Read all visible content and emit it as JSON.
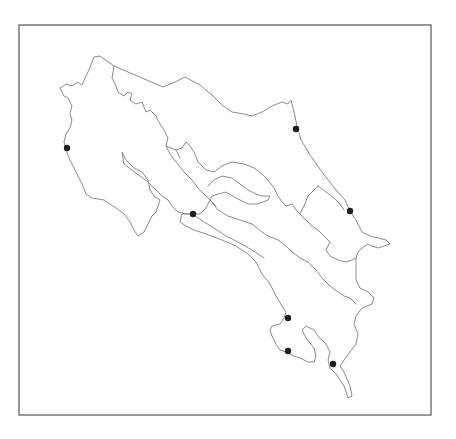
{
  "map": {
    "frame": {
      "x": 19,
      "y": 25,
      "width": 412,
      "height": 390
    },
    "colors": {
      "frame": "#6e6e6e",
      "outline": "#8a8a8a",
      "marker": "#1e1e1e",
      "background": "#ffffff"
    },
    "outlines": [
      "M60,88 L66,84 L72,86 L78,82 L82,85 L85,78 L88,72 L94,57 L100,56 L114,66 L163,87 L175,82 L185,77 L200,85 L212,95 L222,105 L232,112 L244,114 L252,116 L262,112 L272,106 L282,102 L288,104 L291,100 L294,112 L297,126 L301,140 L310,155 L322,172 L336,190 L345,200 L350,211 L356,220 L362,232 L370,236 L378,238 L386,240 L390,244 L384,246 L378,248 L372,246 L368,244 L362,248 L358,252 L356,258 L356,280 L360,288 L368,292 L374,298 L372,304 L362,308 L356,316 L354,324 L358,334 L356,344 L350,352 L344,360 L340,366 L344,372 L350,386 L352,396 L348,398 L344,386 L336,374 L330,368 L328,360 L330,352 L326,344 L318,336 L314,330 L306,326 L302,330 L306,338 L314,348 L316,356 L314,362 L308,362 L300,358 L294,356 L286,352 L280,350 L276,344 L272,336 L270,330 L272,326 L280,324 L284,318 L286,312 L282,306 L276,296 L270,284 L262,274 L256,262 L248,254 L236,246 L222,240 L206,234 L194,230 L186,226 L180,222 L182,214 L193,214",
      "M60,88 L64,96 L68,98 L72,106 L70,114 L72,120 L70,128 L66,134 L64,142 L66,150 L70,160 L76,172 L82,184 L86,194 L92,198 L104,200 L116,208 L124,214 L130,222 L134,230 L138,236 L144,232 L148,224 L152,216 L156,212 L160,200 L154,196 L150,190 L148,180 L142,172 L134,168 L126,160 L122,152 L124,164",
      "M124,164 L132,170 L140,176 L148,182 L156,190 L162,196 L168,200 L172,206 L178,212 L186,214 L193,214",
      "M114,66 L112,78 L116,86 L118,92 L124,96 L128,92 L132,94 L130,100 L136,104 L142,102 L146,112 L150,110 L156,116 L160,124 L164,130 L168,138 L166,146 L176,150 L180,158",
      "M166,146 L170,154 L176,162 L184,172 L192,180 L198,188 L204,194 L210,200 L216,206",
      "M176,150 L182,148 L186,142 L190,146 L194,152 L198,162 L206,170 L214,172 L222,166 L232,162 L244,164 L254,168 L262,174 L268,180 L274,188 L278,196 L282,202 L286,206 L292,204 L296,210 L300,214 L306,220 L312,226 L318,230 L324,236 L330,242",
      "M208,186 L214,180 L222,176 L232,178 L240,184 L248,190 L256,194 L262,196 L270,196 L268,200 L258,204 L248,204 L236,198 L226,192 L218,194 L212,196",
      "M212,196 L206,208 L200,214 L193,214",
      "M210,200 L218,210 L228,216 L240,220 L252,224 L262,232 L268,236 L278,240 L286,246 L292,252 L300,258 L308,262 L316,270 L322,278 L330,286 L338,292 L344,296 L350,298 L356,304",
      "M193,214 L204,222 L214,228 L226,236 L238,242 L252,250 L264,258",
      "M330,242 L326,250 L330,256 L338,260 L346,262 L352,260 L356,258",
      "M300,214 L304,206 L308,196 L314,190 L318,186",
      "M318,186 L326,192 L334,198 L340,204 L344,210"
    ],
    "markers": [
      {
        "name": "marker-west-coast",
        "cx": 67,
        "cy": 148,
        "r": 3.2
      },
      {
        "name": "marker-north-east-coast",
        "cx": 296,
        "cy": 129,
        "r": 3.2
      },
      {
        "name": "marker-gulf",
        "cx": 193,
        "cy": 214,
        "r": 3.2
      },
      {
        "name": "marker-east-coast",
        "cx": 350,
        "cy": 211,
        "r": 3.2
      },
      {
        "name": "marker-south-1",
        "cx": 288,
        "cy": 318,
        "r": 3.2
      },
      {
        "name": "marker-south-2",
        "cx": 288,
        "cy": 351,
        "r": 3.2
      },
      {
        "name": "marker-south-3",
        "cx": 333,
        "cy": 364,
        "r": 3.2
      }
    ]
  }
}
